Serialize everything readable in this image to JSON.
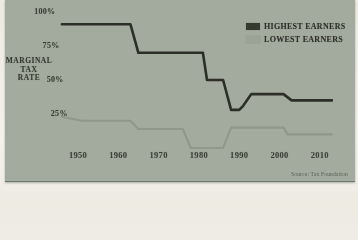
{
  "figure": {
    "axis_title_lines": [
      "MARGINAL",
      "TAX",
      "RATE"
    ],
    "source_note": "Source: Tax Foundation",
    "legend": {
      "items": [
        {
          "label": "HIGHEST EARNERS",
          "swatch_color": "#373a2f"
        },
        {
          "label": "LOWEST EARNERS",
          "swatch_color": "#9ba494"
        }
      ]
    }
  },
  "chart_data": {
    "type": "line",
    "title": "",
    "ylabel": "MARGINAL TAX RATE",
    "xlabel": "",
    "xlim": [
      1946,
      2013
    ],
    "ylim": [
      0,
      100
    ],
    "grid": false,
    "legend_position": "top-right",
    "x_ticks": [
      "1950",
      "1960",
      "1970",
      "1980",
      "1990",
      "2000",
      "2010"
    ],
    "y_ticks": [
      {
        "value": 100,
        "label": "100%"
      },
      {
        "value": 75,
        "label": "75%"
      },
      {
        "value": 50,
        "label": "50%"
      },
      {
        "value": 25,
        "label": "25%"
      }
    ],
    "series": [
      {
        "name": "Highest earners",
        "color": "#2c2f27",
        "stroke_width": 2.6,
        "points": [
          [
            1946,
            91
          ],
          [
            1963,
            91
          ],
          [
            1965,
            70
          ],
          [
            1981,
            70
          ],
          [
            1982,
            50
          ],
          [
            1986,
            50
          ],
          [
            1988,
            28
          ],
          [
            1990,
            28
          ],
          [
            1991,
            31
          ],
          [
            1993,
            39.6
          ],
          [
            2001,
            39.6
          ],
          [
            2003,
            35
          ],
          [
            2013,
            35
          ]
        ]
      },
      {
        "name": "Lowest earners",
        "color": "#8f988b",
        "stroke_width": 2.1,
        "points": [
          [
            1946,
            23
          ],
          [
            1951,
            20
          ],
          [
            1963,
            20
          ],
          [
            1965,
            14
          ],
          [
            1976,
            14
          ],
          [
            1978,
            0
          ],
          [
            1986,
            0
          ],
          [
            1988,
            15
          ],
          [
            2001,
            15
          ],
          [
            2002,
            10
          ],
          [
            2013,
            10
          ]
        ]
      }
    ]
  }
}
